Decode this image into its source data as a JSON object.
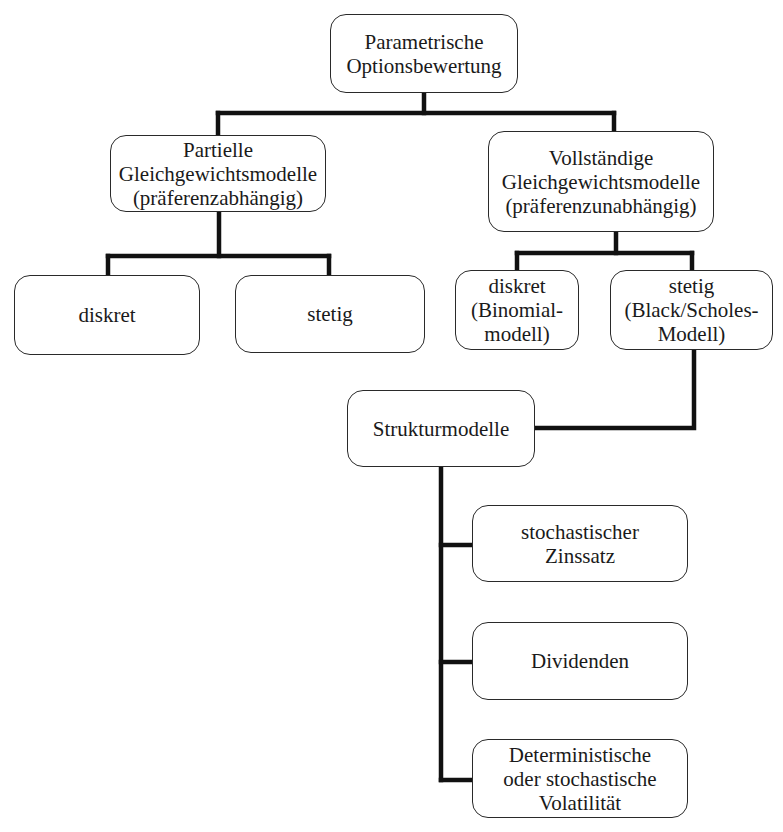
{
  "diagram": {
    "type": "hierarchy",
    "root": {
      "id": "root",
      "label": "Parametrische\nOptionsbewertung"
    },
    "level1": [
      {
        "id": "partial",
        "label": "Partielle\nGleichgewichtsmodelle\n(präferenzabhängig)"
      },
      {
        "id": "complete",
        "label": "Vollständige\nGleichgewichtsmodelle\n(präferenzunabhängig)"
      }
    ],
    "partial_children": [
      {
        "id": "partial-discrete",
        "label": "diskret"
      },
      {
        "id": "partial-continuous",
        "label": "stetig"
      }
    ],
    "complete_children": [
      {
        "id": "binomial",
        "label": "diskret\n(Binomial-\nmodell)"
      },
      {
        "id": "black-scholes",
        "label": "stetig\n(Black/Scholes-\nModell)"
      }
    ],
    "structure": {
      "id": "structure-models",
      "label": "Strukturmodelle"
    },
    "structure_children": [
      {
        "id": "stochastic-rate",
        "label": "stochastischer\nZinssatz"
      },
      {
        "id": "dividends",
        "label": "Dividenden"
      },
      {
        "id": "volatility",
        "label": "Deterministische\noder stochastische\nVolatilität"
      }
    ],
    "edges": [
      [
        "root",
        "partial"
      ],
      [
        "root",
        "complete"
      ],
      [
        "partial",
        "partial-discrete"
      ],
      [
        "partial",
        "partial-continuous"
      ],
      [
        "complete",
        "binomial"
      ],
      [
        "complete",
        "black-scholes"
      ],
      [
        "black-scholes",
        "structure-models"
      ],
      [
        "structure-models",
        "stochastic-rate"
      ],
      [
        "structure-models",
        "dividends"
      ],
      [
        "structure-models",
        "volatility"
      ]
    ],
    "colors": {
      "line": "#111111",
      "border": "#2a2a2a",
      "background": "#ffffff"
    }
  }
}
